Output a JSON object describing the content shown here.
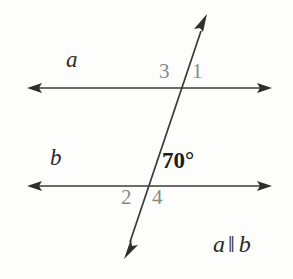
{
  "figure": {
    "type": "geometry-diagram",
    "background_color": "#fdfdfc",
    "stroke_color": "#3a3a3a",
    "label_color": "#2b2b2b",
    "angle_number_color": "#8a8a8a",
    "lines": [
      {
        "name": "line-a",
        "label": "a",
        "label_x": 70,
        "label_y": 50,
        "y": 88,
        "x_start": 27,
        "x_end": 272,
        "arrows": "both"
      },
      {
        "name": "line-b",
        "label": "b",
        "label_x": 54,
        "label_y": 148,
        "y": 186,
        "x_start": 27,
        "x_end": 272,
        "arrows": "both"
      }
    ],
    "transversal": {
      "name": "transversal",
      "x_top": 207,
      "y_top": 14,
      "x_bottom": 124,
      "y_bottom": 259,
      "arrows": "both",
      "intersect_a_x": 183,
      "intersect_b_x": 146
    },
    "angle_numbers": [
      {
        "label": "3",
        "x": 159,
        "y": 62,
        "position": "above-left-of-upper-intersection"
      },
      {
        "label": "1",
        "x": 191,
        "y": 62,
        "position": "above-right-of-upper-intersection"
      },
      {
        "label": "2",
        "x": 121,
        "y": 188,
        "position": "below-left-of-lower-intersection"
      },
      {
        "label": "4",
        "x": 151,
        "y": 188,
        "position": "below-right-of-lower-intersection"
      }
    ],
    "angle_measure": {
      "label": "70°",
      "value": 70,
      "unit": "degrees",
      "x": 162,
      "y": 150,
      "position": "above-right-of-lower-intersection"
    },
    "caption": {
      "left_line": "a",
      "parallel_symbol": "‖",
      "right_line": "b",
      "x": 213,
      "y": 232
    }
  }
}
